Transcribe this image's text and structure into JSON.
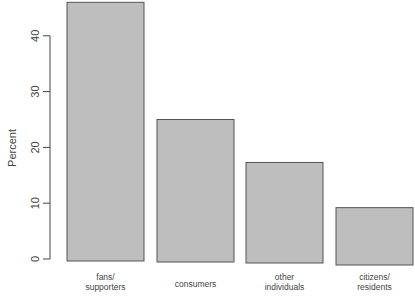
{
  "chart_data": {
    "type": "bar",
    "title": "",
    "xlabel": "",
    "ylabel": "Percent",
    "categories": [
      "fans/\nsupporters",
      "consumers",
      "other\nindividuals",
      "citizens/\nresidents"
    ],
    "category_lines": [
      [
        "fans/",
        "supporters"
      ],
      [
        "consumers"
      ],
      [
        "other",
        "individuals"
      ],
      [
        "citizens/",
        "residents"
      ]
    ],
    "values": [
      46,
      25,
      17.3,
      9.2
    ],
    "ylim": [
      0,
      46
    ],
    "yticks": [
      0,
      10,
      20,
      30,
      40
    ],
    "grid": false,
    "legend": null,
    "colors": {
      "bar_fill": "#bebebe",
      "bar_border": "#555555",
      "axis": "#444444"
    }
  }
}
